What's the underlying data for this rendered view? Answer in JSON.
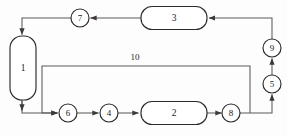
{
  "diagram": {
    "canvas": {
      "width": 287,
      "height": 136
    },
    "colors": {
      "background": "#fdfdfd",
      "node_stroke": "#2b2b2b",
      "edge_stroke": "#5a5a5a",
      "node_fill": "#ffffff",
      "text": "#1a1a1a"
    },
    "nodes": [
      {
        "id": "n1",
        "label": "1",
        "shape": "rounded-rect-vertical",
        "x": 10,
        "y": 36,
        "w": 26,
        "h": 64,
        "rx": 12
      },
      {
        "id": "n3",
        "label": "3",
        "shape": "rounded-rect",
        "x": 141,
        "y": 4,
        "w": 66,
        "h": 23,
        "rx": 11
      },
      {
        "id": "n2",
        "label": "2",
        "shape": "rounded-rect",
        "x": 141,
        "y": 101,
        "w": 66,
        "h": 23,
        "rx": 11
      },
      {
        "id": "n7",
        "label": "7",
        "shape": "circle",
        "cx": 80,
        "cy": 18,
        "r": 9
      },
      {
        "id": "n9",
        "label": "9",
        "shape": "circle",
        "cx": 272,
        "cy": 48,
        "r": 9
      },
      {
        "id": "n5",
        "label": "5",
        "shape": "circle",
        "cx": 272,
        "cy": 84,
        "r": 9
      },
      {
        "id": "n6",
        "label": "6",
        "shape": "circle",
        "cx": 68,
        "cy": 113,
        "r": 9
      },
      {
        "id": "n4",
        "label": "4",
        "shape": "circle",
        "cx": 109,
        "cy": 113,
        "r": 9
      },
      {
        "id": "n8",
        "label": "8",
        "shape": "circle",
        "cx": 231,
        "cy": 113,
        "r": 9
      }
    ],
    "edge_labels": [
      {
        "id": "stream10",
        "label": "10",
        "x": 135,
        "y": 58
      }
    ],
    "edges": [
      {
        "id": "e-7-to-1",
        "from": "n7",
        "to": "n1",
        "arrow": true
      },
      {
        "id": "e-3-to-7",
        "from": "n3",
        "to": "n7",
        "arrow": true
      },
      {
        "id": "e-9-to-3",
        "from": "n9",
        "to": "n3",
        "arrow": true
      },
      {
        "id": "e-5-to-9",
        "from": "n5",
        "to": "n9",
        "arrow": true
      },
      {
        "id": "e-8-to-5",
        "from": "n8",
        "to": "n5",
        "arrow": true
      },
      {
        "id": "e-1-to-6",
        "from": "n1",
        "to": "n6",
        "arrow": true
      },
      {
        "id": "e-6-to-4",
        "from": "n6",
        "to": "n4",
        "arrow": true
      },
      {
        "id": "e-4-to-2",
        "from": "n4",
        "to": "n2",
        "arrow": true
      },
      {
        "id": "e-2-to-8",
        "from": "n2",
        "to": "n8",
        "arrow": true
      },
      {
        "id": "e-recycle-10",
        "from": "n8",
        "to": "n6",
        "arrow": true,
        "label": "10"
      }
    ]
  }
}
